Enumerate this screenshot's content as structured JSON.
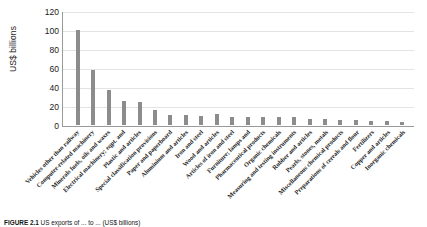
{
  "chart_data": {
    "type": "bar",
    "title": "",
    "xlabel": "",
    "ylabel": "US$ billions",
    "ylim": [
      0,
      120
    ],
    "yticks": [
      0,
      20,
      40,
      60,
      80,
      100,
      120
    ],
    "grid": true,
    "legend": "none",
    "bar_color": "#8c8c8c",
    "categories": [
      "Vehicles other than railway",
      "Computer-related machinery",
      "Minerals fuels, oils and waxes",
      "Electrical machinery; eqpt. and",
      "Plastic and articles",
      "Special classification provisions",
      "Paper and paperboard",
      "Aluminium and articles",
      "Iron and steel",
      "Wood and articles",
      "Articles of iron and steel",
      "Furniture; lamps and",
      "Pharmaceutical products",
      "Organic chemicals",
      "Measuring and testing instruments",
      "Rubber and articles",
      "Pearls, stones, metals",
      "Miscellaneous chemical products",
      "Preparations of cereals and flour",
      "Fertilizers",
      "Copper and articles",
      "Inorganic chemicals"
    ],
    "values": [
      101,
      58,
      37,
      25,
      24,
      16,
      11,
      11,
      10,
      12,
      9,
      9,
      8,
      8,
      9,
      6,
      6,
      5,
      5,
      4,
      4,
      3
    ]
  },
  "caption": {
    "label": "FIGURE 2.1",
    "text": "US exports of ... to ... (US$ billions)"
  }
}
